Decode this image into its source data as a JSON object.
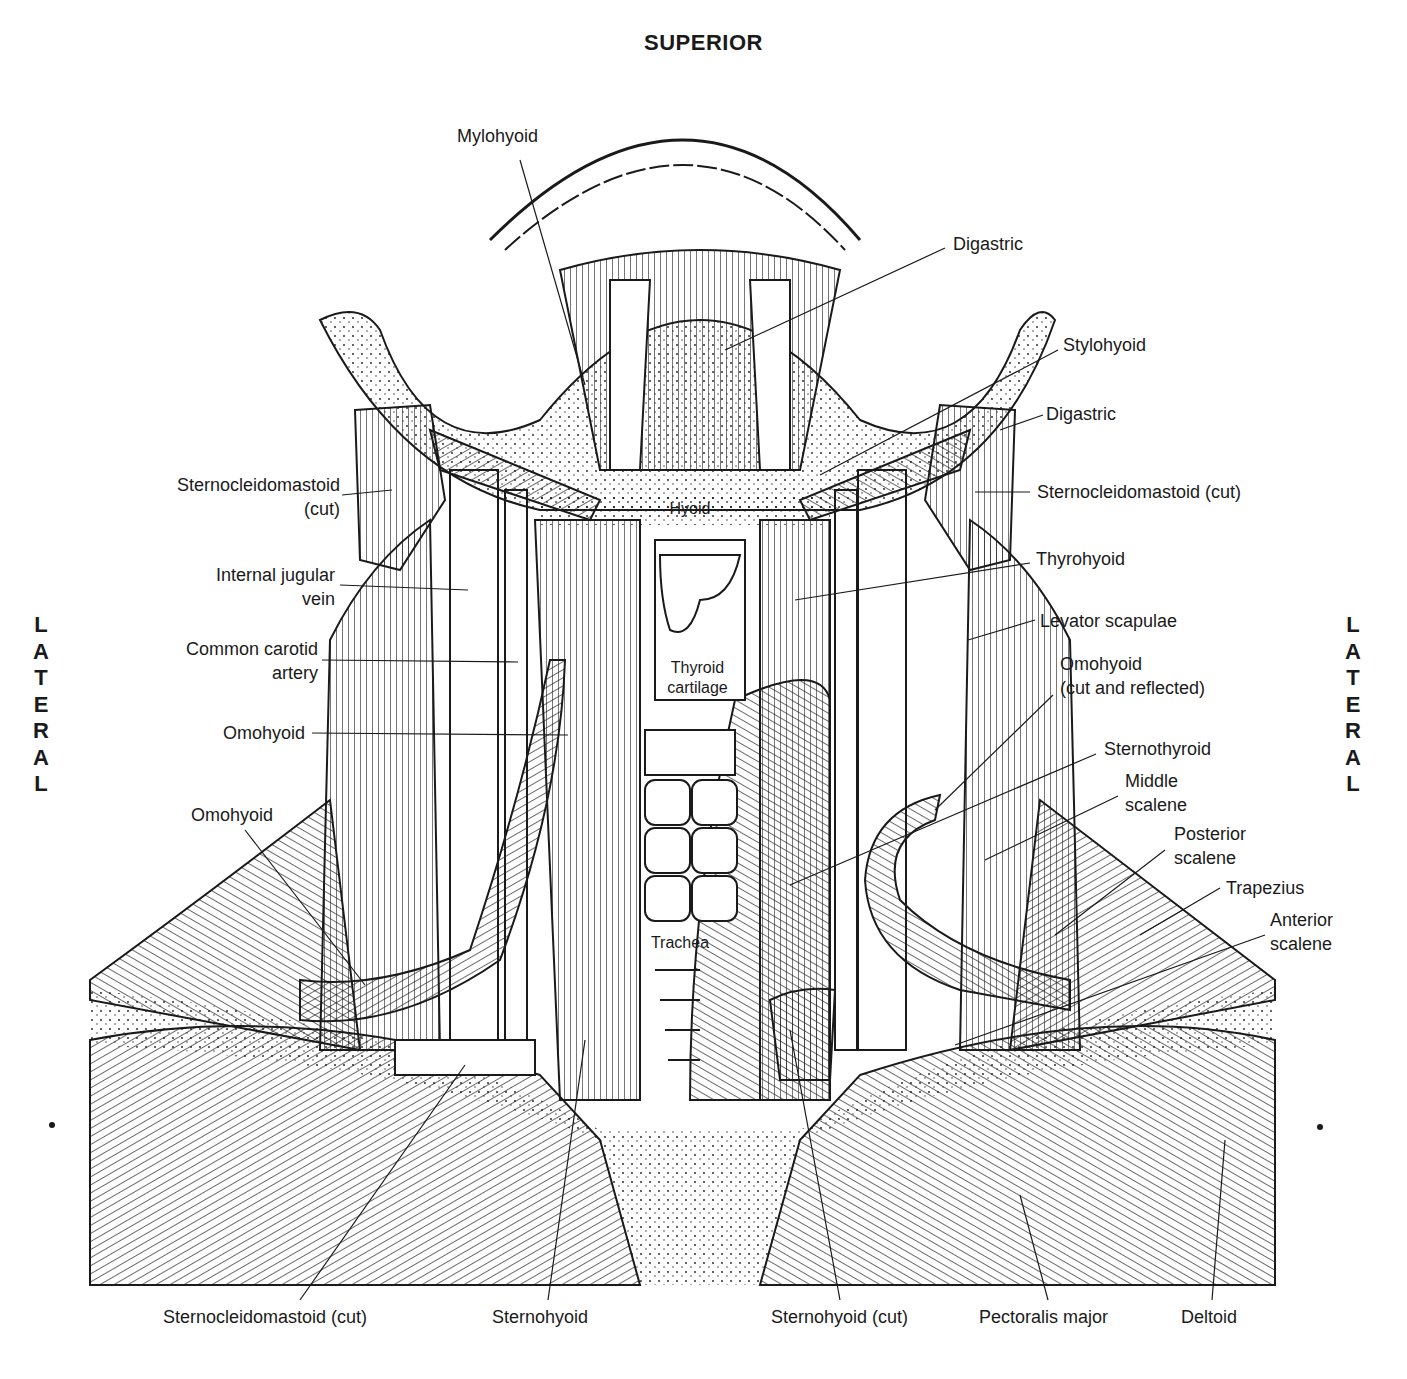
{
  "orientation": {
    "top": "SUPERIOR",
    "left": "LATERAL",
    "right": "LATERAL"
  },
  "labels": {
    "left": [
      {
        "id": "scm_left",
        "lines": [
          "Sternocleidomastoid",
          "(cut)"
        ]
      },
      {
        "id": "ijv",
        "lines": [
          "Internal jugular",
          "vein"
        ]
      },
      {
        "id": "cca",
        "lines": [
          "Common carotid",
          "artery"
        ]
      },
      {
        "id": "omohyoid_left_mid",
        "lines": [
          "Omohyoid"
        ]
      },
      {
        "id": "omohyoid_left_low",
        "lines": [
          "Omohyoid"
        ]
      }
    ],
    "top": [
      {
        "id": "mylohyoid",
        "lines": [
          "Mylohyoid"
        ]
      }
    ],
    "right": [
      {
        "id": "digastric_top",
        "lines": [
          "Digastric"
        ]
      },
      {
        "id": "stylohyoid",
        "lines": [
          "Stylohyoid"
        ]
      },
      {
        "id": "digastric_2",
        "lines": [
          "Digastric"
        ]
      },
      {
        "id": "scm_right",
        "lines": [
          "Sternocleidomastoid (cut)"
        ]
      },
      {
        "id": "thyrohyoid",
        "lines": [
          "Thyrohyoid"
        ]
      },
      {
        "id": "levator",
        "lines": [
          "Levator scapulae"
        ]
      },
      {
        "id": "omohyoid_right",
        "lines": [
          "Omohyoid",
          "(cut and reflected)"
        ]
      },
      {
        "id": "sternothyroid",
        "lines": [
          "Sternothyroid"
        ]
      },
      {
        "id": "middle_scalene",
        "lines": [
          "Middle",
          "scalene"
        ]
      },
      {
        "id": "posterior_scalene",
        "lines": [
          "Posterior",
          "scalene"
        ]
      },
      {
        "id": "trapezius",
        "lines": [
          "Trapezius"
        ]
      },
      {
        "id": "anterior_scalene",
        "lines": [
          "Anterior",
          "scalene"
        ]
      }
    ],
    "bottom": [
      {
        "id": "scm_bottom",
        "lines": [
          "Sternocleidomastoid (cut)"
        ]
      },
      {
        "id": "sternohyoid",
        "lines": [
          "Sternohyoid"
        ]
      },
      {
        "id": "sternohyoid_cut",
        "lines": [
          "Sternohyoid (cut)"
        ]
      },
      {
        "id": "pectoralis",
        "lines": [
          "Pectoralis major"
        ]
      },
      {
        "id": "deltoid",
        "lines": [
          "Deltoid"
        ]
      }
    ],
    "inner": [
      {
        "id": "hyoid",
        "lines": [
          "Hyoid"
        ]
      },
      {
        "id": "thyroid_cartilage",
        "lines": [
          "Thyroid",
          "cartilage"
        ]
      },
      {
        "id": "trachea",
        "lines": [
          "Trachea"
        ]
      }
    ]
  },
  "colors": {
    "ink": "#1a1a1a",
    "paper": "#ffffff"
  }
}
